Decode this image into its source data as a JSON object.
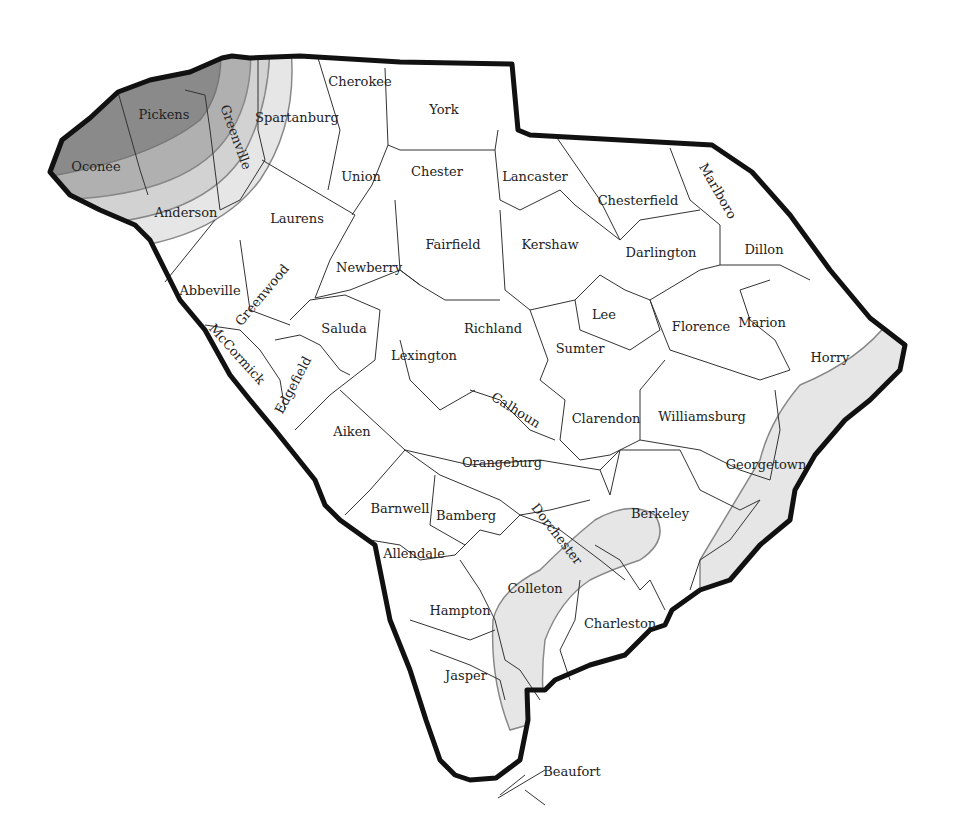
{
  "map": {
    "title": "South Carolina counties",
    "colors": {
      "outline": "#111111",
      "county_line": "#333333",
      "shade_dark": "#8a8a8a",
      "shade_mid": "#b0b0b0",
      "shade_light": "#d2d2d2",
      "shade_lightest": "#e6e6e6",
      "zone_line": "#888888"
    },
    "counties": [
      {
        "name": "Pickens",
        "x": 164,
        "y": 114,
        "rot": 0
      },
      {
        "name": "Oconee",
        "x": 96,
        "y": 166,
        "rot": 0
      },
      {
        "name": "Greenville",
        "x": 236,
        "y": 137,
        "rot": 70
      },
      {
        "name": "Spartanburg",
        "x": 297,
        "y": 117,
        "rot": 0
      },
      {
        "name": "Cherokee",
        "x": 360,
        "y": 81,
        "rot": 0
      },
      {
        "name": "York",
        "x": 444,
        "y": 109,
        "rot": 0
      },
      {
        "name": "Union",
        "x": 361,
        "y": 176,
        "rot": 0
      },
      {
        "name": "Chester",
        "x": 437,
        "y": 171,
        "rot": 0
      },
      {
        "name": "Lancaster",
        "x": 535,
        "y": 176,
        "rot": 0
      },
      {
        "name": "Chesterfield",
        "x": 638,
        "y": 200,
        "rot": 0
      },
      {
        "name": "Marlboro",
        "x": 718,
        "y": 191,
        "rot": 60
      },
      {
        "name": "Anderson",
        "x": 186,
        "y": 212,
        "rot": 0
      },
      {
        "name": "Laurens",
        "x": 297,
        "y": 218,
        "rot": 0
      },
      {
        "name": "Fairfield",
        "x": 453,
        "y": 244,
        "rot": 0
      },
      {
        "name": "Kershaw",
        "x": 550,
        "y": 244,
        "rot": 0
      },
      {
        "name": "Darlington",
        "x": 661,
        "y": 252,
        "rot": 0
      },
      {
        "name": "Dillon",
        "x": 764,
        "y": 249,
        "rot": 0
      },
      {
        "name": "Newberry",
        "x": 369,
        "y": 267,
        "rot": 0
      },
      {
        "name": "Abbeville",
        "x": 210,
        "y": 290,
        "rot": 0
      },
      {
        "name": "Greenwood",
        "x": 262,
        "y": 295,
        "rot": -50
      },
      {
        "name": "Lee",
        "x": 604,
        "y": 314,
        "rot": 0
      },
      {
        "name": "Saluda",
        "x": 344,
        "y": 328,
        "rot": 0
      },
      {
        "name": "Richland",
        "x": 493,
        "y": 328,
        "rot": 0
      },
      {
        "name": "Florence",
        "x": 701,
        "y": 326,
        "rot": 0
      },
      {
        "name": "Marion",
        "x": 762,
        "y": 322,
        "rot": 0
      },
      {
        "name": "Horry",
        "x": 830,
        "y": 357,
        "rot": 0
      },
      {
        "name": "McCormick",
        "x": 237,
        "y": 354,
        "rot": 48
      },
      {
        "name": "Sumter",
        "x": 580,
        "y": 348,
        "rot": 0
      },
      {
        "name": "Lexington",
        "x": 424,
        "y": 355,
        "rot": 0
      },
      {
        "name": "Edgefield",
        "x": 293,
        "y": 385,
        "rot": -62
      },
      {
        "name": "Calhoun",
        "x": 516,
        "y": 410,
        "rot": 32
      },
      {
        "name": "Clarendon",
        "x": 606,
        "y": 418,
        "rot": 0
      },
      {
        "name": "Williamsburg",
        "x": 702,
        "y": 416,
        "rot": 0
      },
      {
        "name": "Aiken",
        "x": 352,
        "y": 431,
        "rot": 0
      },
      {
        "name": "Orangeburg",
        "x": 502,
        "y": 462,
        "rot": 0
      },
      {
        "name": "Georgetown",
        "x": 766,
        "y": 464,
        "rot": 0
      },
      {
        "name": "Barnwell",
        "x": 400,
        "y": 508,
        "rot": 0
      },
      {
        "name": "Bamberg",
        "x": 466,
        "y": 515,
        "rot": 0
      },
      {
        "name": "Dorchester",
        "x": 557,
        "y": 534,
        "rot": 52
      },
      {
        "name": "Berkeley",
        "x": 660,
        "y": 513,
        "rot": 0
      },
      {
        "name": "Allendale",
        "x": 414,
        "y": 553,
        "rot": 0
      },
      {
        "name": "Colleton",
        "x": 535,
        "y": 588,
        "rot": 0
      },
      {
        "name": "Hampton",
        "x": 460,
        "y": 610,
        "rot": 0
      },
      {
        "name": "Charleston",
        "x": 620,
        "y": 623,
        "rot": 0
      },
      {
        "name": "Jasper",
        "x": 466,
        "y": 675,
        "rot": 0
      },
      {
        "name": "Beaufort",
        "x": 572,
        "y": 771,
        "rot": 0
      }
    ]
  }
}
